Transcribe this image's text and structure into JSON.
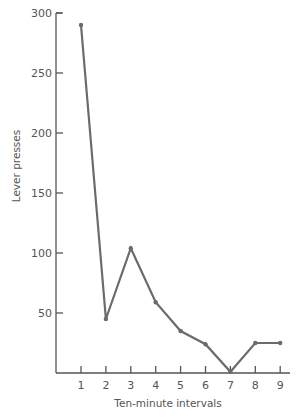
{
  "chart_data": {
    "type": "line",
    "title": "",
    "xlabel": "Ten-minute intervals",
    "ylabel": "Lever presses",
    "categories": [
      "1",
      "2",
      "3",
      "4",
      "5",
      "6",
      "7",
      "8",
      "9"
    ],
    "x": [
      1,
      2,
      3,
      4,
      5,
      6,
      7,
      8,
      9
    ],
    "series": [
      {
        "name": "Lever presses",
        "values": [
          290,
          45,
          104,
          59,
          35,
          24,
          1,
          25,
          25
        ]
      }
    ],
    "yticks": [
      50,
      100,
      150,
      200,
      250,
      300
    ],
    "xticks": [
      1,
      2,
      3,
      4,
      5,
      6,
      7,
      8,
      9
    ],
    "ylim": [
      0,
      300
    ],
    "xlim": [
      0,
      9.4
    ],
    "grid": false,
    "legend": "none",
    "colors": {
      "line": "#6b6b6b",
      "axis": "#555555",
      "text": "#555555"
    }
  }
}
